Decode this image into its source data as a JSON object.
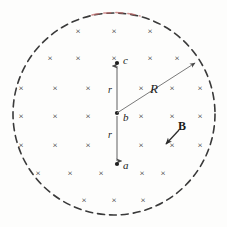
{
  "figure": {
    "background_color": "#fdfdfc",
    "ink_color": "#262626",
    "accent_color": "#b05a5a",
    "canvas": {
      "width": 227,
      "height": 227
    }
  },
  "field_region": {
    "name": "dashed-circle",
    "style": "dashed",
    "center": {
      "x": 114,
      "y": 114
    },
    "radius": 101,
    "stroke_color": "#3a3a3a",
    "stroke_width": 1.6,
    "dash_pattern": "7 5",
    "highlight_arc_color": "#c06a6a"
  },
  "field_symbols": {
    "glyph": "×",
    "meaning": "magnetic-field-into-page",
    "font_size_px": 9,
    "rows": [
      {
        "y": 31,
        "xs": [
          78,
          114,
          150
        ]
      },
      {
        "y": 58,
        "xs": [
          50,
          78,
          114,
          150,
          177
        ]
      },
      {
        "y": 88,
        "xs": [
          21,
          55,
          88,
          141,
          172,
          200
        ]
      },
      {
        "y": 116,
        "xs": [
          21,
          55,
          88,
          141,
          172,
          200
        ]
      },
      {
        "y": 145,
        "xs": [
          21,
          55,
          88,
          141,
          172,
          200
        ]
      },
      {
        "y": 173,
        "xs": [
          38,
          70,
          101,
          142,
          163
        ]
      },
      {
        "y": 200,
        "xs": [
          84,
          114,
          143
        ]
      }
    ]
  },
  "axis": {
    "name": "vertical-double-arrow",
    "x": 117,
    "top_y": 64,
    "bottom_y": 163,
    "center_y": 113,
    "stroke_color": "#6b6b6b",
    "stroke_width": 1.2
  },
  "points": [
    {
      "id": "c",
      "label": "c",
      "x": 117,
      "y": 64,
      "label_dx": 5,
      "label_dy": -4,
      "dot": true
    },
    {
      "id": "b",
      "label": "b",
      "x": 117,
      "y": 113,
      "label_dx": 5,
      "label_dy": 5,
      "dot": true
    },
    {
      "id": "a",
      "label": "a",
      "x": 117,
      "y": 163,
      "label_dx": 5,
      "label_dy": 4,
      "dot": true
    }
  ],
  "distance_labels": [
    {
      "id": "r-upper",
      "label": "r",
      "x": 112,
      "y": 90
    },
    {
      "id": "r-lower",
      "label": "r",
      "x": 112,
      "y": 135
    }
  ],
  "radius_annotation": {
    "label": "R",
    "label_x": 152,
    "label_y": 88,
    "line_from": {
      "x": 117,
      "y": 113
    },
    "line_to": {
      "x": 196,
      "y": 62
    },
    "stroke_color": "#6b6b6b",
    "stroke_width": 1.0,
    "arrow": "to-circle-edge"
  },
  "field_annotation": {
    "label": "B",
    "label_x": 180,
    "label_y": 128,
    "line_from": {
      "x": 178,
      "y": 131
    },
    "line_to": {
      "x": 166,
      "y": 144
    },
    "stroke_color": "#3a3a3a",
    "stroke_width": 1.2,
    "arrow": "to-field-symbol"
  }
}
